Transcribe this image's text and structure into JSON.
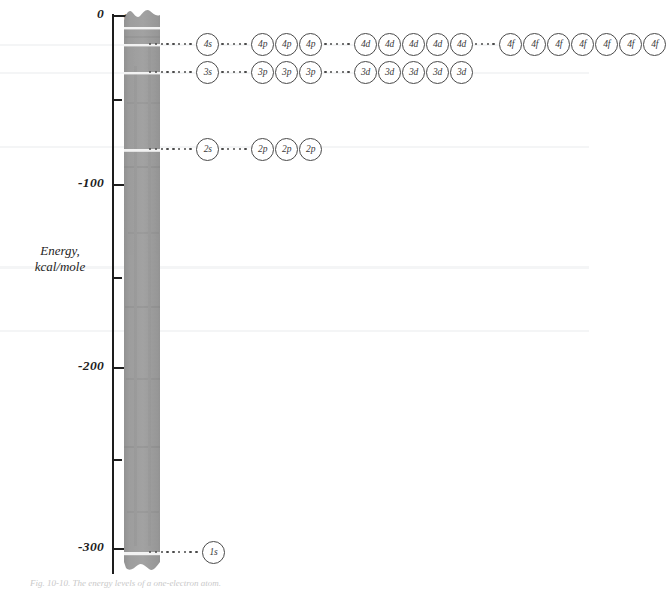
{
  "figure": {
    "axis": {
      "title_line1": "Energy,",
      "title_line2": "kcal/mole",
      "arrow_label": "n",
      "zero_label": "0",
      "infinity_label": "∞",
      "tick_labels": [
        "0",
        "-100",
        "-200",
        "-300"
      ],
      "minor_ticks": [
        "-50",
        "-150",
        "-250"
      ],
      "n_labels": [
        "5",
        "4",
        "3",
        "2",
        "1"
      ]
    },
    "rows": [
      {
        "n": "4",
        "groups": [
          {
            "lead": 8,
            "orbitals": [
              "4s"
            ]
          },
          {
            "lead": 5,
            "orbitals": [
              "4p",
              "4p",
              "4p"
            ]
          },
          {
            "lead": 5,
            "orbitals": [
              "4d",
              "4d",
              "4d",
              "4d",
              "4d"
            ]
          },
          {
            "lead": 4,
            "orbitals": [
              "4f",
              "4f",
              "4f",
              "4f",
              "4f",
              "4f",
              "4f"
            ]
          }
        ]
      },
      {
        "n": "3",
        "groups": [
          {
            "lead": 8,
            "orbitals": [
              "3s"
            ]
          },
          {
            "lead": 5,
            "orbitals": [
              "3p",
              "3p",
              "3p"
            ]
          },
          {
            "lead": 5,
            "orbitals": [
              "3d",
              "3d",
              "3d",
              "3d",
              "3d"
            ]
          }
        ]
      },
      {
        "n": "2",
        "groups": [
          {
            "lead": 8,
            "orbitals": [
              "2s"
            ]
          },
          {
            "lead": 5,
            "orbitals": [
              "2p",
              "2p",
              "2p"
            ]
          }
        ]
      },
      {
        "n": "1",
        "groups": [
          {
            "lead": 9,
            "orbitals": [
              "1s"
            ]
          }
        ]
      }
    ],
    "caption": "Fig. 10-10.  The energy levels of a one-electron atom.",
    "colors": {
      "ink": "#1d1d1d",
      "circle_ink": "#4a4a4a",
      "bar_gray": "#9a9a9a",
      "paper": "#ffffff"
    }
  },
  "chart_data": {
    "type": "scatter",
    "title": "Energy levels of a one-electron atom",
    "ylabel": "Energy, kcal/mole",
    "xlabel": "",
    "ylim": [
      -340,
      5
    ],
    "yticks": [
      0,
      -100,
      -200,
      -300
    ],
    "minor_yticks": [
      -50,
      -150,
      -250
    ],
    "grid": false,
    "legend": "none",
    "series": [
      {
        "name": "n = 4",
        "energy": -20,
        "y_px": 43,
        "orbitals": [
          "4s",
          "4p",
          "4p",
          "4p",
          "4d",
          "4d",
          "4d",
          "4d",
          "4d",
          "4f",
          "4f",
          "4f",
          "4f",
          "4f",
          "4f",
          "4f"
        ]
      },
      {
        "name": "n = 3",
        "energy": -36,
        "y_px": 71,
        "orbitals": [
          "3s",
          "3p",
          "3p",
          "3p",
          "3d",
          "3d",
          "3d",
          "3d",
          "3d"
        ]
      },
      {
        "name": "n = 2",
        "energy": -82,
        "y_px": 148,
        "orbitals": [
          "2s",
          "2p",
          "2p",
          "2p"
        ]
      },
      {
        "name": "n = 1",
        "energy": -313,
        "y_px": 551,
        "orbitals": [
          "1s"
        ]
      }
    ],
    "annotations": [
      {
        "text": "∞",
        "y_px": 17
      },
      {
        "text": "5",
        "y_px": 28
      },
      {
        "text": "4",
        "y_px": 45
      },
      {
        "text": "3",
        "y_px": 73
      },
      {
        "text": "2",
        "y_px": 150
      },
      {
        "text": "1",
        "y_px": 553
      }
    ]
  }
}
